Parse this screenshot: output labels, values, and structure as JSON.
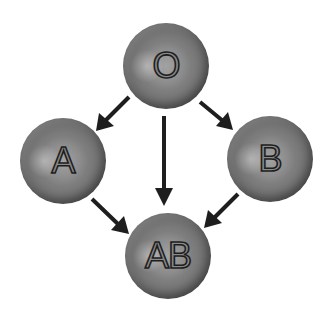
{
  "diagram": {
    "type": "directed-graph",
    "nodes": [
      {
        "id": "O",
        "label": "O"
      },
      {
        "id": "A",
        "label": "A"
      },
      {
        "id": "B",
        "label": "B"
      },
      {
        "id": "AB",
        "label": "AB"
      }
    ],
    "edges": [
      {
        "from": "O",
        "to": "A"
      },
      {
        "from": "O",
        "to": "B"
      },
      {
        "from": "O",
        "to": "AB"
      },
      {
        "from": "A",
        "to": "AB"
      },
      {
        "from": "B",
        "to": "AB"
      }
    ],
    "colors": {
      "node_fill": "#7c7c7c",
      "node_rim": "#3a3a3a",
      "arrow": "#1e1e1e",
      "background": "#ffffff"
    }
  }
}
